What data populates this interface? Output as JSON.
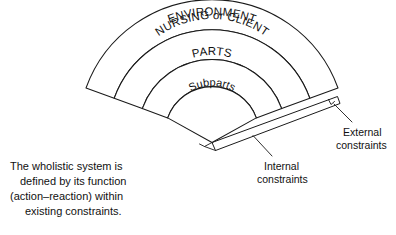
{
  "diagram": {
    "title_hidden": "",
    "bands": [
      {
        "id": "environment",
        "label": "ENVIRONMENT"
      },
      {
        "id": "nursing-or-client",
        "label": "NURSING or CLIENT"
      },
      {
        "id": "parts",
        "label": "PARTS"
      },
      {
        "id": "subparts",
        "label": "Subparts"
      }
    ],
    "callouts": [
      {
        "id": "external-constraints",
        "line1": "External",
        "line2": "constraints"
      },
      {
        "id": "internal-constraints",
        "line1": "Internal",
        "line2": "constraints"
      }
    ],
    "caption": {
      "line1": "The wholistic system is",
      "line2": "defined by its function",
      "line3": "(action–reaction) within",
      "line4": "existing constraints."
    },
    "colors": {
      "stroke": "#1a1a1a",
      "fill": "#ffffff",
      "text": "#111111",
      "background": "#ffffff"
    }
  }
}
